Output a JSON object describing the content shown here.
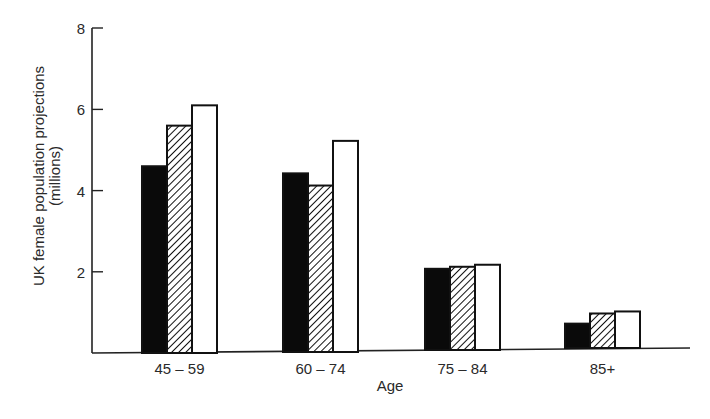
{
  "chart_data": {
    "type": "bar",
    "title": "",
    "xlabel": "Age",
    "ylabel": "UK female population projections",
    "ylabel_line2": "(millions)",
    "categories": [
      "45 – 59",
      "60 – 74",
      "75 – 84",
      "85+"
    ],
    "series": [
      {
        "name": "Series 1 (solid black)",
        "fill": "solid",
        "color": "#000000",
        "values": [
          4.6,
          4.4,
          2.0,
          0.6
        ]
      },
      {
        "name": "Series 2 (diagonal hatch)",
        "fill": "hatch",
        "color": "#000000",
        "values": [
          5.6,
          4.1,
          2.05,
          0.85
        ]
      },
      {
        "name": "Series 3 (white/open)",
        "fill": "open",
        "color": "#ffffff",
        "values": [
          6.1,
          5.2,
          2.1,
          0.9
        ]
      }
    ],
    "yticks": [
      2,
      4,
      6,
      8
    ],
    "ylim": [
      0,
      8
    ],
    "grid": false,
    "legend": "none visible"
  },
  "axes": {
    "y_ticks": [
      "2",
      "4",
      "6",
      "8"
    ],
    "x_ticks": [
      "45 – 59",
      "60 – 74",
      "75 – 84",
      "85+"
    ],
    "x_title": "Age",
    "y_title_line1": "UK female population projections",
    "y_title_line2": "(millions)"
  }
}
